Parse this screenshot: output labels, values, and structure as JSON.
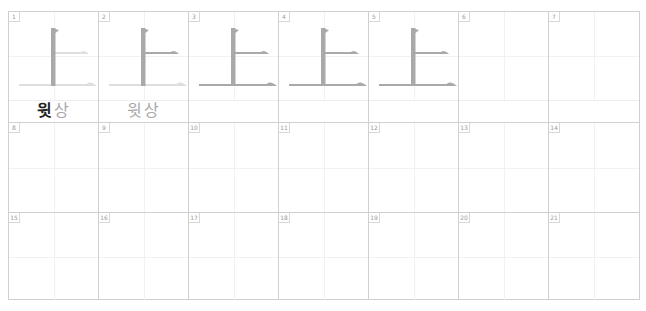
{
  "worksheet": {
    "character": "上",
    "stroke_count": 3,
    "colors": {
      "grid_line": "#d0d0d0",
      "guide_line": "#f1f1f1",
      "stroke_done": "#a9a9a9",
      "stroke_pending": "#dedede",
      "label_strong": "#222222",
      "label_soft": "#a8a8a8"
    },
    "rows": [
      {
        "cells": [
          {
            "number": "1",
            "strokes_done": 1,
            "label_meaning": "윗",
            "label_sound": "상",
            "label_meaning_style": "strong"
          },
          {
            "number": "2",
            "strokes_done": 2,
            "label_meaning": "윗",
            "label_sound": "상",
            "label_meaning_style": "soft"
          },
          {
            "number": "3",
            "strokes_done": 3
          },
          {
            "number": "4",
            "strokes_done": 3
          },
          {
            "number": "5",
            "strokes_done": 3
          },
          {
            "number": "6",
            "strokes_done": 0
          },
          {
            "number": "7",
            "strokes_done": 0
          }
        ]
      },
      {
        "cells": [
          {
            "number": "8"
          },
          {
            "number": "9"
          },
          {
            "number": "10"
          },
          {
            "number": "11"
          },
          {
            "number": "12"
          },
          {
            "number": "13"
          },
          {
            "number": "14"
          }
        ]
      },
      {
        "cells": [
          {
            "number": "15"
          },
          {
            "number": "16"
          },
          {
            "number": "17"
          },
          {
            "number": "18"
          },
          {
            "number": "19"
          },
          {
            "number": "20"
          },
          {
            "number": "21"
          }
        ]
      }
    ]
  }
}
